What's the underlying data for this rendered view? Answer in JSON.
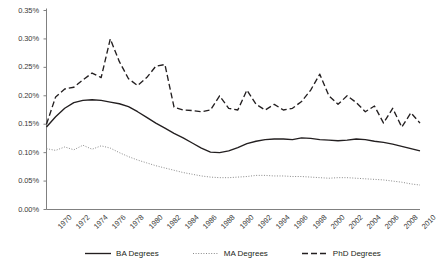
{
  "chart_data": {
    "type": "line",
    "title": "",
    "xlabel": "",
    "ylabel": "",
    "xlim": [
      1970,
      2011
    ],
    "ylim": [
      0.0,
      0.35
    ],
    "grid": false,
    "legend_position": "bottom",
    "y_ticks": [
      "0.00%",
      "0.05%",
      "0.10%",
      "0.15%",
      "0.20%",
      "0.25%",
      "0.30%",
      "0.35%"
    ],
    "y_tick_values": [
      0.0,
      0.05,
      0.1,
      0.15,
      0.2,
      0.25,
      0.3,
      0.35
    ],
    "x_tick_labels": [
      "1970",
      "1972",
      "1974",
      "1976",
      "1978",
      "1980",
      "1982",
      "1984",
      "1986",
      "1988",
      "1990",
      "1992",
      "1994",
      "1996",
      "1998",
      "2000",
      "2002",
      "2004",
      "2006",
      "2008",
      "2010"
    ],
    "x": [
      1970,
      1971,
      1972,
      1973,
      1974,
      1975,
      1976,
      1977,
      1978,
      1979,
      1980,
      1981,
      1982,
      1983,
      1984,
      1985,
      1986,
      1987,
      1988,
      1989,
      1990,
      1991,
      1992,
      1993,
      1994,
      1995,
      1996,
      1997,
      1998,
      1999,
      2000,
      2001,
      2002,
      2003,
      2004,
      2005,
      2006,
      2007,
      2008,
      2009,
      2010,
      2011
    ],
    "series": [
      {
        "name": "BA Degrees",
        "style": "solid",
        "color": "#231f20",
        "values": [
          0.145,
          0.163,
          0.178,
          0.188,
          0.192,
          0.193,
          0.192,
          0.189,
          0.186,
          0.181,
          0.172,
          0.162,
          0.152,
          0.143,
          0.134,
          0.126,
          0.117,
          0.108,
          0.101,
          0.1,
          0.103,
          0.109,
          0.116,
          0.12,
          0.123,
          0.124,
          0.124,
          0.123,
          0.126,
          0.125,
          0.123,
          0.122,
          0.121,
          0.122,
          0.124,
          0.123,
          0.12,
          0.118,
          0.115,
          0.111,
          0.107,
          0.103
        ]
      },
      {
        "name": "MA Degrees",
        "style": "dotted",
        "color": "#8a8a8a",
        "values": [
          0.107,
          0.104,
          0.11,
          0.105,
          0.113,
          0.106,
          0.112,
          0.108,
          0.1,
          0.093,
          0.087,
          0.082,
          0.077,
          0.073,
          0.069,
          0.065,
          0.062,
          0.059,
          0.057,
          0.056,
          0.056,
          0.057,
          0.058,
          0.06,
          0.06,
          0.059,
          0.059,
          0.058,
          0.058,
          0.057,
          0.056,
          0.055,
          0.056,
          0.056,
          0.055,
          0.054,
          0.053,
          0.052,
          0.05,
          0.048,
          0.045,
          0.043
        ]
      },
      {
        "name": "PhD Degrees",
        "style": "dashed",
        "color": "#231f20",
        "values": [
          0.15,
          0.198,
          0.212,
          0.215,
          0.228,
          0.24,
          0.232,
          0.3,
          0.26,
          0.23,
          0.218,
          0.232,
          0.252,
          0.255,
          0.18,
          0.175,
          0.174,
          0.172,
          0.175,
          0.2,
          0.178,
          0.175,
          0.21,
          0.185,
          0.175,
          0.185,
          0.175,
          0.178,
          0.19,
          0.21,
          0.238,
          0.2,
          0.185,
          0.2,
          0.188,
          0.172,
          0.182,
          0.152,
          0.178,
          0.145,
          0.17,
          0.152
        ]
      }
    ]
  },
  "legend": {
    "items": [
      {
        "label": "BA Degrees",
        "style": "solid"
      },
      {
        "label": "MA Degrees",
        "style": "dotted"
      },
      {
        "label": "PhD Degrees",
        "style": "dashed"
      }
    ]
  },
  "axes": {
    "axis_color": "#808080"
  }
}
